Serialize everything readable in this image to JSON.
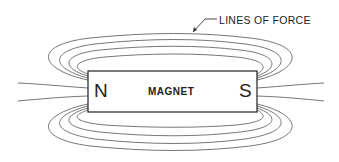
{
  "diagram": {
    "callout_label": "LINES OF FORCE",
    "magnet": {
      "label": "MAGNET",
      "north": "N",
      "south": "S"
    },
    "colors": {
      "line": "#555555",
      "box": "#222222",
      "bg": "#ffffff"
    }
  }
}
